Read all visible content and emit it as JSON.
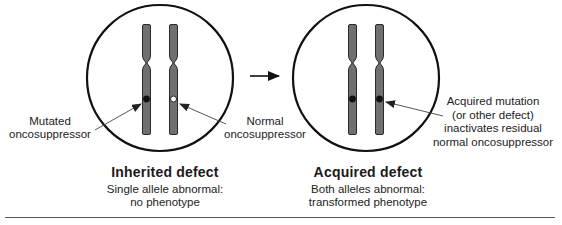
{
  "panels": [
    {
      "title": "Inherited defect",
      "subtitle_line1": "Single allele abnormal:",
      "subtitle_line2": "no phenotype",
      "chromosomes": [
        {
          "marker": "filled"
        },
        {
          "marker": "open"
        }
      ],
      "labels": {
        "left_line1": "Mutated",
        "left_line2": "oncosuppressor",
        "right_line1": "Normal",
        "right_line2": "oncosuppressor"
      }
    },
    {
      "title": "Acquired defect",
      "subtitle_line1": "Both alleles abnormal:",
      "subtitle_line2": "transformed phenotype",
      "chromosomes": [
        {
          "marker": "filled"
        },
        {
          "marker": "filled"
        }
      ],
      "labels": {
        "right_line1": "Acquired mutation",
        "right_line2": "(or other defect)",
        "right_line3": "inactivates residual",
        "right_line4": "normal oncosuppressor"
      }
    }
  ],
  "transition_arrow": "right-arrow",
  "colors": {
    "chromosome_fill": "#707070",
    "chromosome_stroke": "#2a2a2a",
    "outline": "#111111",
    "pointer_line": "#444444"
  }
}
